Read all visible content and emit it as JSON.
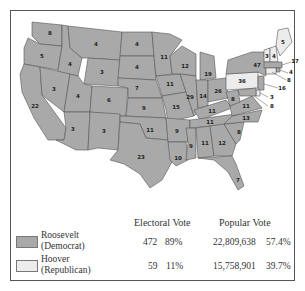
{
  "colors": {
    "roosevelt": "#a9a9a9",
    "hoover": "#ececec",
    "border": "#555555"
  },
  "map": {
    "states": [
      {
        "name": "Washington",
        "ev": "8",
        "party": "dem"
      },
      {
        "name": "Oregon",
        "ev": "5",
        "party": "dem"
      },
      {
        "name": "California",
        "ev": "22",
        "party": "dem"
      },
      {
        "name": "Idaho",
        "ev": "4",
        "party": "dem"
      },
      {
        "name": "Nevada",
        "ev": "3",
        "party": "dem"
      },
      {
        "name": "Montana",
        "ev": "4",
        "party": "dem"
      },
      {
        "name": "Wyoming",
        "ev": "3",
        "party": "dem"
      },
      {
        "name": "Utah",
        "ev": "4",
        "party": "dem"
      },
      {
        "name": "Arizona",
        "ev": "3",
        "party": "dem"
      },
      {
        "name": "Colorado",
        "ev": "6",
        "party": "dem"
      },
      {
        "name": "New Mexico",
        "ev": "3",
        "party": "dem"
      },
      {
        "name": "North Dakota",
        "ev": "4",
        "party": "dem"
      },
      {
        "name": "South Dakota",
        "ev": "4",
        "party": "dem"
      },
      {
        "name": "Nebraska",
        "ev": "7",
        "party": "dem"
      },
      {
        "name": "Kansas",
        "ev": "9",
        "party": "dem"
      },
      {
        "name": "Oklahoma",
        "ev": "11",
        "party": "dem"
      },
      {
        "name": "Texas",
        "ev": "23",
        "party": "dem"
      },
      {
        "name": "Minnesota",
        "ev": "11",
        "party": "dem"
      },
      {
        "name": "Iowa",
        "ev": "11",
        "party": "dem"
      },
      {
        "name": "Missouri",
        "ev": "15",
        "party": "dem"
      },
      {
        "name": "Arkansas",
        "ev": "9",
        "party": "dem"
      },
      {
        "name": "Louisiana",
        "ev": "10",
        "party": "dem"
      },
      {
        "name": "Wisconsin",
        "ev": "12",
        "party": "dem"
      },
      {
        "name": "Illinois",
        "ev": "29",
        "party": "dem"
      },
      {
        "name": "Michigan",
        "ev": "19",
        "party": "dem"
      },
      {
        "name": "Indiana",
        "ev": "14",
        "party": "dem"
      },
      {
        "name": "Ohio",
        "ev": "26",
        "party": "dem"
      },
      {
        "name": "Kentucky",
        "ev": "11",
        "party": "dem"
      },
      {
        "name": "Tennessee",
        "ev": "11",
        "party": "dem"
      },
      {
        "name": "Mississippi",
        "ev": "9",
        "party": "dem"
      },
      {
        "name": "Alabama",
        "ev": "11",
        "party": "dem"
      },
      {
        "name": "Georgia",
        "ev": "12",
        "party": "dem"
      },
      {
        "name": "Florida",
        "ev": "7",
        "party": "dem"
      },
      {
        "name": "South Carolina",
        "ev": "8",
        "party": "dem"
      },
      {
        "name": "North Carolina",
        "ev": "13",
        "party": "dem"
      },
      {
        "name": "Virginia",
        "ev": "11",
        "party": "dem"
      },
      {
        "name": "West Virginia",
        "ev": "8",
        "party": "dem"
      },
      {
        "name": "Pennsylvania",
        "ev": "36",
        "party": "rep"
      },
      {
        "name": "New York",
        "ev": "47",
        "party": "dem"
      },
      {
        "name": "Vermont",
        "ev": "3",
        "party": "rep"
      },
      {
        "name": "New Hampshire",
        "ev": "4",
        "party": "rep"
      },
      {
        "name": "Maine",
        "ev": "5",
        "party": "rep"
      },
      {
        "name": "Massachusetts",
        "ev": "17",
        "party": "dem"
      },
      {
        "name": "Rhode Island",
        "ev": "4",
        "party": "dem"
      },
      {
        "name": "Connecticut",
        "ev": "8",
        "party": "rep"
      },
      {
        "name": "New Jersey",
        "ev": "16",
        "party": "dem"
      },
      {
        "name": "Delaware",
        "ev": "3",
        "party": "rep"
      },
      {
        "name": "Maryland",
        "ev": "8",
        "party": "dem"
      }
    ]
  },
  "legend": {
    "headers": {
      "electoral": "Electoral Vote",
      "popular": "Popular Vote"
    },
    "rows": [
      {
        "name1": "Roosevelt",
        "name2": "(Democrat)",
        "ev": "472",
        "ev_pct": "89%",
        "pv": "22,809,638",
        "pv_pct": "57.4%"
      },
      {
        "name1": "Hoover",
        "name2": "(Republican)",
        "ev": "59",
        "ev_pct": "11%",
        "pv": "15,758,901",
        "pv_pct": "39.7%"
      }
    ]
  }
}
